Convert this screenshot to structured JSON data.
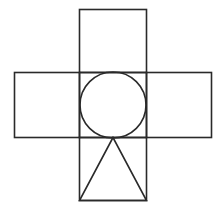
{
  "diagram": {
    "title": "",
    "stroke_color": "#2a2a2a",
    "background": "#ffffff",
    "shapes": {
      "top_square": {
        "x": 79.5,
        "y": 9.5,
        "w": 67,
        "h": 63
      },
      "left_rect": {
        "x": 14.5,
        "y": 72.5,
        "w": 65,
        "h": 65
      },
      "center_square": {
        "x": 79.5,
        "y": 72.5,
        "w": 67,
        "h": 65
      },
      "right_rect": {
        "x": 146.5,
        "y": 72.5,
        "w": 65,
        "h": 65
      },
      "bottom_square": {
        "x": 79.5,
        "y": 137.5,
        "w": 67,
        "h": 63
      },
      "circle": {
        "cx": 113,
        "cy": 105,
        "r": 33
      },
      "triangle": {
        "points": "113,137.5 79.5,200.5 146.5,200.5"
      }
    }
  }
}
